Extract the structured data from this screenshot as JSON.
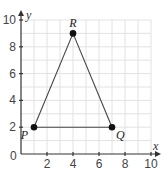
{
  "chart_data": {
    "type": "scatter",
    "title": "",
    "xlabel": "x",
    "ylabel": "y",
    "xlim": [
      0,
      10
    ],
    "ylim": [
      0,
      10
    ],
    "grid": true,
    "origin_label": "0",
    "x_ticks": [
      {
        "value": 2,
        "label": "2"
      },
      {
        "value": 4,
        "label": "4"
      },
      {
        "value": 6,
        "label": "6"
      },
      {
        "value": 8,
        "label": "8"
      },
      {
        "value": 10,
        "label": "10"
      }
    ],
    "y_ticks": [
      {
        "value": 2,
        "label": "2"
      },
      {
        "value": 4,
        "label": "4"
      },
      {
        "value": 6,
        "label": "6"
      },
      {
        "value": 8,
        "label": "8"
      },
      {
        "value": 10,
        "label": "10"
      }
    ],
    "points": [
      {
        "name": "P",
        "x": 1,
        "y": 2,
        "label_pos": "below-left"
      },
      {
        "name": "R",
        "x": 4,
        "y": 9,
        "label_pos": "above"
      },
      {
        "name": "Q",
        "x": 7,
        "y": 2,
        "label_pos": "below-right"
      }
    ],
    "segments": [
      {
        "from": "P",
        "to": "R"
      },
      {
        "from": "R",
        "to": "Q"
      },
      {
        "from": "P",
        "to": "Q"
      }
    ]
  },
  "colors": {
    "grid": "#e2e2e2",
    "axis": "#333333",
    "segment": "#444444",
    "point": "#111111"
  }
}
